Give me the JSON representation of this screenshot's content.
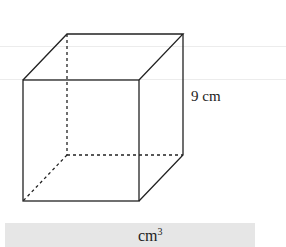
{
  "figure": {
    "shape": "cube",
    "edge_label": "9 cm",
    "stroke_color": "#222222"
  },
  "answer": {
    "unit_base": "cm",
    "unit_exponent": "3",
    "box_color": "#e6e6e6"
  }
}
